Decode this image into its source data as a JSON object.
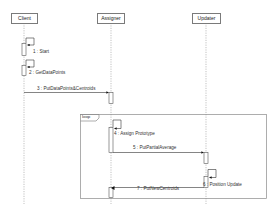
{
  "diagram": {
    "type": "sequence",
    "participants": [
      {
        "name": "Client"
      },
      {
        "name": "Assigner"
      },
      {
        "name": "Updater"
      }
    ],
    "fragment": {
      "operator": "loop"
    },
    "messages": [
      {
        "label": "1 : Start",
        "from": "Client",
        "to": "Client"
      },
      {
        "label": "2 : GetDataPoints",
        "from": "Client",
        "to": "Client"
      },
      {
        "label": "3 : PutDataPoints&Centroids",
        "from": "Client",
        "to": "Assigner"
      },
      {
        "label": "4 : Assign Prototype",
        "from": "Assigner",
        "to": "Assigner"
      },
      {
        "label": "5 : PutPartialAverage",
        "from": "Assigner",
        "to": "Updater"
      },
      {
        "label": "6 : Position Update",
        "from": "Updater",
        "to": "Updater"
      },
      {
        "label": "7 : PutNewCentroids",
        "from": "Updater",
        "to": "Assigner"
      }
    ]
  }
}
